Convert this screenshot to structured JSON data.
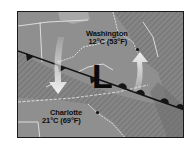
{
  "map": {
    "title": "Weather front map",
    "pressure_center": {
      "symbol": "L",
      "meaning": "low-pressure"
    },
    "cities": [
      {
        "name": "Washington",
        "temp": "12°C (53°F)"
      },
      {
        "name": "Charlotte",
        "temp": "21°C (69°F)"
      }
    ],
    "front": {
      "type": "stationary-front",
      "cold_side_symbol": "triangles",
      "warm_side_symbol": "semicircles"
    },
    "arrows": [
      {
        "direction": "down",
        "meaning": "cold-air-flow"
      },
      {
        "direction": "up",
        "meaning": "warm-air-flow"
      }
    ],
    "colors": {
      "background": "#8e8e8e",
      "hatch_region": "#7a7a7a",
      "front_line": "#1a1a1a",
      "borders": "#e6e6e6",
      "arrow": "#f0f0f0"
    }
  }
}
